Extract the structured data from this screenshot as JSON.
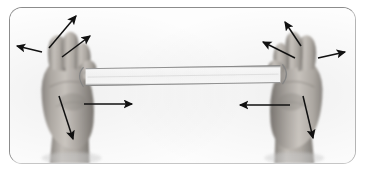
{
  "figure": {
    "caption": "",
    "media_type": "photograph",
    "color_mode": "grayscale",
    "frame": {
      "shape": "rounded-rectangle",
      "border_color": "#8c8c8c",
      "corner_radius_px": 13,
      "background_color": "#fdfdfd"
    }
  },
  "colors": {
    "arrow": "#111111",
    "band_highlight": "#ffffff",
    "band_edge": "#8a8a8a",
    "skin_light": "#d8d4cf",
    "skin_mid": "#a8a39d",
    "skin_dark": "#6e6a66",
    "shadow": "#4a4744",
    "background": "#ffffff"
  },
  "objects": [
    {
      "name": "left-hand",
      "description": "Left fist, palm facing away, fingers curled, gripping the band",
      "side": "left"
    },
    {
      "name": "right-hand",
      "description": "Right fist, palm facing away, fingers curled, gripping the band",
      "side": "right"
    },
    {
      "name": "resistance-band",
      "description": "White flat elastic band stretched horizontally between the two fists",
      "orientation": "horizontal"
    }
  ],
  "arrows": [
    {
      "id": "left-index-up",
      "label": "up-right from left index finger",
      "x1": 49,
      "y1": 48,
      "x2": 76,
      "y2": 16,
      "hand": "left"
    },
    {
      "id": "left-thumb-up",
      "label": "up-right from left thumb",
      "x1": 62,
      "y1": 57,
      "x2": 90,
      "y2": 36,
      "hand": "left"
    },
    {
      "id": "left-finger-out",
      "label": "left from left little finger",
      "x1": 42,
      "y1": 52,
      "x2": 17,
      "y2": 46,
      "hand": "left"
    },
    {
      "id": "left-wrist-right",
      "label": "right from left wrist",
      "x1": 84,
      "y1": 104,
      "x2": 132,
      "y2": 104,
      "hand": "left"
    },
    {
      "id": "left-wrist-down",
      "label": "down-right from left wrist",
      "x1": 59,
      "y1": 96,
      "x2": 73,
      "y2": 139,
      "hand": "left"
    },
    {
      "id": "right-index-up",
      "label": "up-left from right index finger",
      "x1": 301,
      "y1": 46,
      "x2": 285,
      "y2": 22,
      "hand": "right"
    },
    {
      "id": "right-thumb-left",
      "label": "up-left from right thumb",
      "x1": 295,
      "y1": 58,
      "x2": 263,
      "y2": 42,
      "hand": "right"
    },
    {
      "id": "right-finger-out",
      "label": "right from right little finger",
      "x1": 318,
      "y1": 58,
      "x2": 345,
      "y2": 52,
      "hand": "right"
    },
    {
      "id": "right-wrist-left",
      "label": "left from right wrist",
      "x1": 290,
      "y1": 105,
      "x2": 240,
      "y2": 105,
      "hand": "right"
    },
    {
      "id": "right-wrist-down",
      "label": "down-right from right wrist",
      "x1": 303,
      "y1": 96,
      "x2": 313,
      "y2": 138,
      "hand": "right"
    }
  ]
}
